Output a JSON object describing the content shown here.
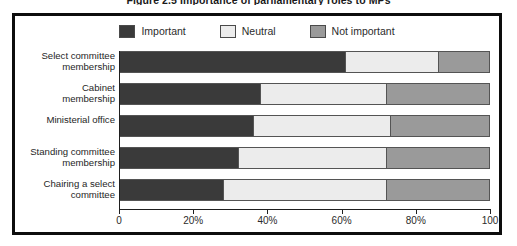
{
  "figure": {
    "caption": "Figure 2.5   Importance of parliamentary roles to MPs"
  },
  "chart_data": {
    "type": "bar",
    "orientation": "horizontal",
    "stacked": true,
    "stack_total": 100,
    "title": "Figure 2.5   Importance of parliamentary roles to MPs",
    "xlabel": "",
    "ylabel": "",
    "xlim": [
      0,
      100
    ],
    "grid": false,
    "legend_position": "top-center",
    "x_ticks": [
      {
        "value": 0,
        "label": "0"
      },
      {
        "value": 20,
        "label": "20%"
      },
      {
        "value": 40,
        "label": "40%"
      },
      {
        "value": 60,
        "label": "60%"
      },
      {
        "value": 80,
        "label": "80%"
      },
      {
        "value": 100,
        "label": "100"
      }
    ],
    "categories": [
      "Select committee\nmembership",
      "Cabinet\nmembership",
      "Ministerial office",
      "Standing committee\nmembership",
      "Chairing a select\ncommittee"
    ],
    "series": [
      {
        "name": "Important",
        "color": "#3a3a3a",
        "values": [
          61,
          38,
          36,
          32,
          28
        ]
      },
      {
        "name": "Neutral",
        "color": "#ececec",
        "values": [
          25,
          34,
          37,
          40,
          44
        ]
      },
      {
        "name": "Not important",
        "color": "#9a9a9a",
        "values": [
          14,
          28,
          27,
          28,
          28
        ]
      }
    ]
  }
}
